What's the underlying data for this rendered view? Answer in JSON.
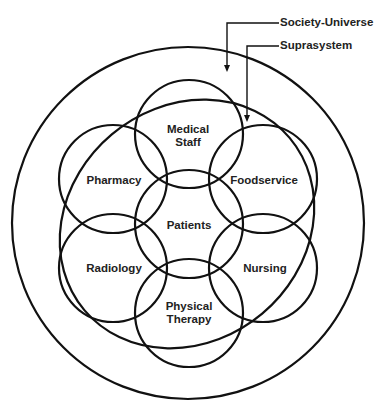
{
  "diagram": {
    "type": "venn-system-diagram",
    "callouts": {
      "society_universe": "Society-Universe",
      "suprasystem": "Suprasystem"
    },
    "nodes": [
      {
        "id": "medical-staff",
        "line1": "Medical",
        "line2": "Staff"
      },
      {
        "id": "pharmacy",
        "line1": "Pharmacy",
        "line2": ""
      },
      {
        "id": "foodservice",
        "line1": "Foodservice",
        "line2": ""
      },
      {
        "id": "patients",
        "line1": "Patients",
        "line2": ""
      },
      {
        "id": "radiology",
        "line1": "Radiology",
        "line2": ""
      },
      {
        "id": "nursing",
        "line1": "Nursing",
        "line2": ""
      },
      {
        "id": "physical-therapy",
        "line1": "Physical",
        "line2": "Therapy"
      }
    ],
    "colors": {
      "stroke": "#111111",
      "text": "#222222",
      "background": "#ffffff"
    }
  }
}
